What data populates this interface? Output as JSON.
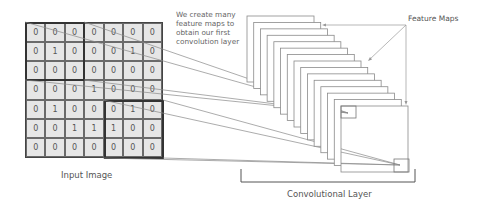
{
  "input_image": {
    "label": "Input Image",
    "rows": [
      [
        "0",
        "0",
        "0",
        "0",
        "0",
        "0",
        "0"
      ],
      [
        "0",
        "1",
        "0",
        "0",
        "0",
        "1",
        "0"
      ],
      [
        "0",
        "0",
        "0",
        "0",
        "0",
        "0",
        "0"
      ],
      [
        "0",
        "0",
        "0",
        "1",
        "0",
        "0",
        "0"
      ],
      [
        "0",
        "1",
        "0",
        "0",
        "0",
        "1",
        "0"
      ],
      [
        "0",
        "0",
        "1",
        "1",
        "1",
        "0",
        "0"
      ],
      [
        "0",
        "0",
        "0",
        "0",
        "0",
        "0",
        "0"
      ]
    ],
    "highlighted_windows": [
      {
        "row": 0,
        "col": 0,
        "size": 3
      },
      {
        "row": 4,
        "col": 4,
        "size": 3
      }
    ]
  },
  "annotation": "We create many feature maps to obtain our first convolution layer",
  "feature_maps": {
    "label": "Feature Maps",
    "count": 15
  },
  "convolutional_layer": {
    "label": "Convolutional Layer"
  },
  "colors": {
    "cell_fill": "#e6e6e6",
    "grid_line": "#6a6a6a",
    "connector_line": "#888888",
    "text": "#555555"
  }
}
